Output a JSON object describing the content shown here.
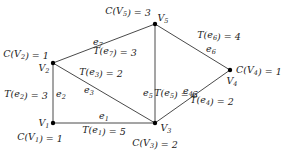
{
  "diagram": {
    "type": "graph",
    "nodes": [
      {
        "id": "V1",
        "label": "V1",
        "cost": "C(V1) = 1"
      },
      {
        "id": "V2",
        "label": "V2",
        "cost": "C(V2) = 1"
      },
      {
        "id": "V3",
        "label": "V3",
        "cost": "C(V3) = 2"
      },
      {
        "id": "V4",
        "label": "V4",
        "cost": "C(V4) = 1"
      },
      {
        "id": "V5",
        "label": "V5",
        "cost": "C(V5) = 3"
      }
    ],
    "edges": [
      {
        "id": "e1",
        "from": "V1",
        "to": "V3",
        "label": "e1",
        "weight": "T(e1) = 5"
      },
      {
        "id": "e2",
        "from": "V1",
        "to": "V2",
        "label": "e2",
        "weight": "T(e2) = 3"
      },
      {
        "id": "e3",
        "from": "V2",
        "to": "V3",
        "label": "e3",
        "weight": "T(e3) = 2"
      },
      {
        "id": "e4",
        "from": "V3",
        "to": "V4",
        "label": "e4",
        "weight": "T(e4) = 2"
      },
      {
        "id": "e5",
        "from": "V3",
        "to": "V5",
        "label": "e5",
        "weight": "T(e5) = 6"
      },
      {
        "id": "e6",
        "from": "V5",
        "to": "V4",
        "label": "e6",
        "weight": "T(e6) = 4"
      },
      {
        "id": "e7",
        "from": "V2",
        "to": "V5",
        "label": "e7",
        "weight": "T(e7) = 3"
      }
    ]
  }
}
